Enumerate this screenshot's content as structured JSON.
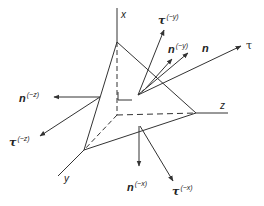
{
  "diagram": {
    "colors": {
      "line": "#333333",
      "background": "#ffffff"
    },
    "axes": {
      "x": {
        "label": "x"
      },
      "y": {
        "label": "y"
      },
      "z": {
        "label": "z"
      }
    },
    "vectors": {
      "n": {
        "symbol": "n",
        "sup": ""
      },
      "tau": {
        "symbol": "τ",
        "sup": ""
      },
      "n_neg_y": {
        "symbol": "n",
        "sup": "(−y)"
      },
      "tau_neg_y": {
        "symbol": "τ",
        "sup": "(−y)"
      },
      "n_neg_z": {
        "symbol": "n",
        "sup": "(−z)"
      },
      "tau_neg_z": {
        "symbol": "τ",
        "sup": "(−z)"
      },
      "n_neg_x": {
        "symbol": "n",
        "sup": "(−x)"
      },
      "tau_neg_x": {
        "symbol": "τ",
        "sup": "(−x)"
      }
    }
  }
}
